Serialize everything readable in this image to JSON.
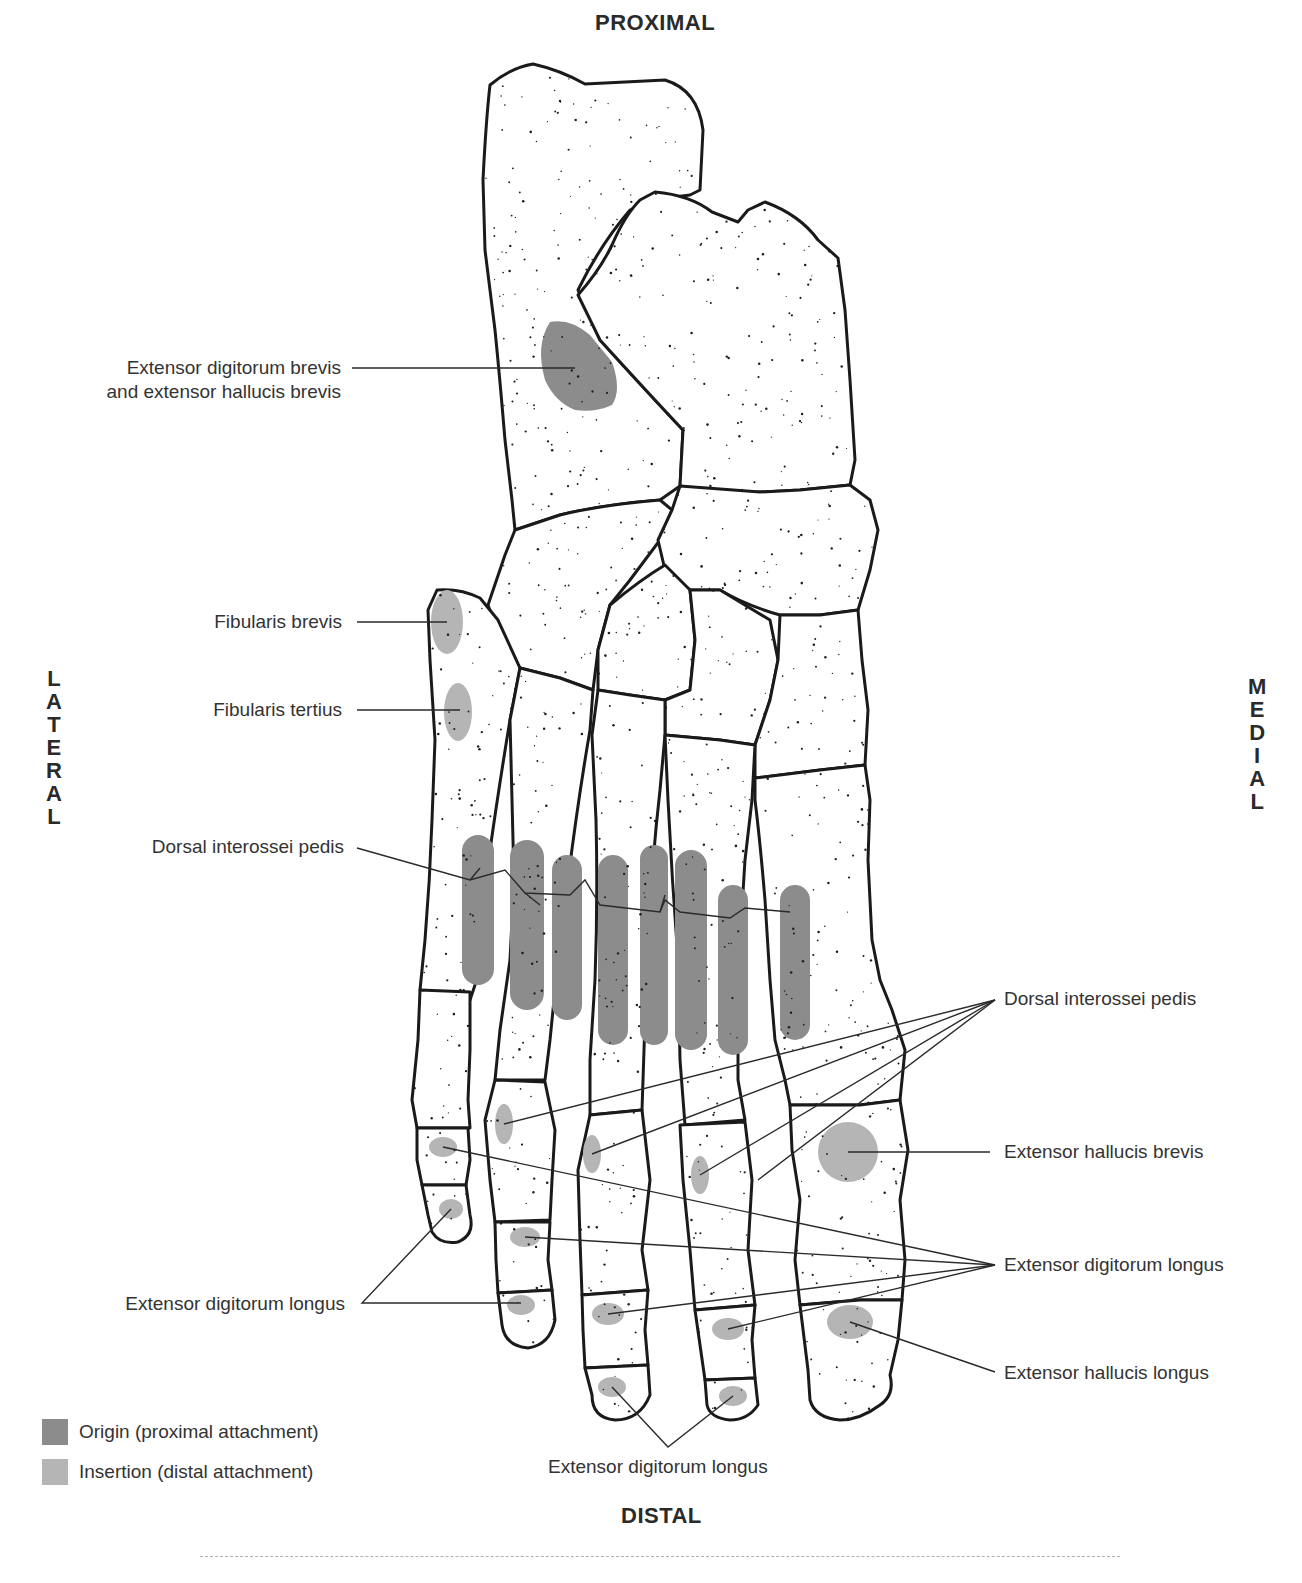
{
  "orientation": {
    "top": "PROXIMAL",
    "bottom": "DISTAL",
    "left": "LATERAL",
    "right": "MEDIAL"
  },
  "labels": {
    "edb_ehb_line1": "Extensor digitorum brevis",
    "edb_ehb_line2": "and extensor hallucis brevis",
    "fibularis_brevis": "Fibularis brevis",
    "fibularis_tertius": "Fibularis tertius",
    "dorsal_interossei_left": "Dorsal interossei pedis",
    "dorsal_interossei_right": "Dorsal interossei pedis",
    "extensor_hallucis_brevis": "Extensor hallucis brevis",
    "extensor_digitorum_longus_right": "Extensor digitorum longus",
    "extensor_hallucis_longus": "Extensor hallucis longus",
    "extensor_digitorum_longus_left": "Extensor digitorum longus",
    "extensor_digitorum_longus_bottom": "Extensor digitorum longus"
  },
  "legend": {
    "items": [
      {
        "label": "Origin (proximal attachment)",
        "color": "#8c8c8c"
      },
      {
        "label": "Insertion (distal attachment)",
        "color": "#b5b5b5"
      }
    ]
  },
  "colors": {
    "origin": "#8c8c8c",
    "insertion": "#b5b5b5",
    "bone_outline": "#1a1a1a"
  }
}
